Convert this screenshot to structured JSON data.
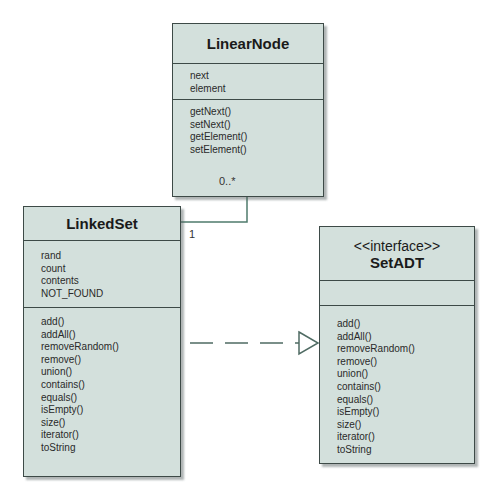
{
  "classes": {
    "linear_node": {
      "name": "LinearNode",
      "attributes": [
        "next",
        "element"
      ],
      "methods": [
        "getNext()",
        "setNext()",
        "getElement()",
        "setElement()"
      ]
    },
    "linked_set": {
      "name": "LinkedSet",
      "attributes": [
        "rand",
        "count",
        "contents",
        "NOT_FOUND"
      ],
      "methods": [
        "add()",
        "addAll()",
        "removeRandom()",
        "remove()",
        "union()",
        "contains()",
        "equals()",
        "isEmpty()",
        "size()",
        "iterator()",
        "toString"
      ]
    },
    "set_adt": {
      "stereotype": "<<interface>>",
      "name": "SetADT",
      "attributes": [],
      "methods": [
        "add()",
        "addAll()",
        "removeRandom()",
        "remove()",
        "union()",
        "contains()",
        "equals()",
        "isEmpty()",
        "size()",
        "iterator()",
        "toString"
      ]
    }
  },
  "relationships": {
    "association": {
      "from": "LinkedSet",
      "to": "LinearNode",
      "from_multiplicity": "1",
      "to_multiplicity": "0..*"
    },
    "realization": {
      "from": "LinkedSet",
      "to": "SetADT"
    }
  },
  "colors": {
    "box_fill": "#d3e0dc",
    "border": "#3d4a47",
    "connector": "#4f7b6c"
  }
}
